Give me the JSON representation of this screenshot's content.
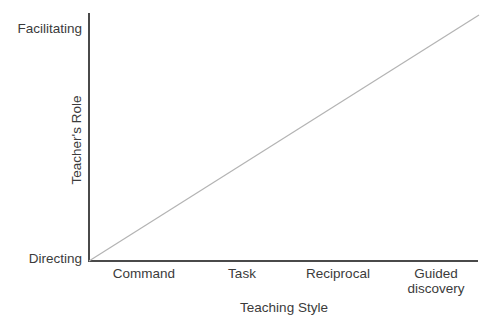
{
  "chart_data": {
    "type": "line",
    "title": "",
    "xlabel": "Teaching Style",
    "ylabel": "Teacher's Role",
    "categories": [
      "Command",
      "Task",
      "Reciprocal",
      "Guided discovery"
    ],
    "x": [
      0,
      1,
      2,
      3
    ],
    "series": [
      {
        "name": "Teacher's Role vs Teaching Style",
        "values": [
          0,
          0.333,
          0.667,
          1
        ],
        "color": "#b3b3b3"
      }
    ],
    "y_tick_labels": [
      "Directing",
      "Facilitating"
    ],
    "ylim": [
      0,
      1
    ],
    "xlim": [
      0,
      3
    ],
    "grid": false,
    "legend": "none",
    "axis_color": "#4a4a4a",
    "text_color": "#3b3b3b",
    "background": "#ffffff"
  },
  "axis": {
    "y_top_label": "Facilitating",
    "y_bottom_label": "Directing",
    "y_title": "Teacher's Role",
    "x_title": "Teaching Style",
    "x_ticks": [
      {
        "label": "Command",
        "line2": "",
        "center_px": 144
      },
      {
        "label": "Task",
        "line2": "",
        "center_px": 242
      },
      {
        "label": "Reciprocal",
        "line2": "",
        "center_px": 338
      },
      {
        "label": "Guided",
        "line2": "discovery",
        "center_px": 436
      }
    ]
  }
}
